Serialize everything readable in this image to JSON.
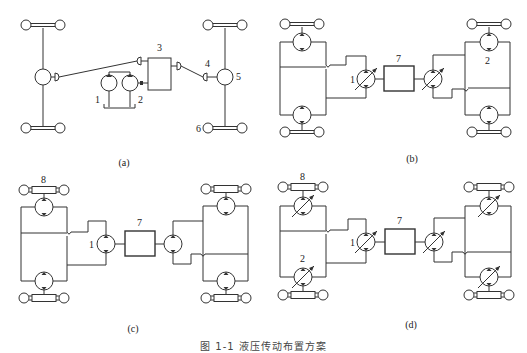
{
  "figure": {
    "caption": "图 1-1  液压传动布置方案",
    "panels": [
      {
        "id": "a",
        "label": "(a)",
        "callouts": [
          "1",
          "2",
          "3",
          "4",
          "5",
          "6"
        ]
      },
      {
        "id": "b",
        "label": "(b)",
        "callouts": [
          "1",
          "7",
          "2"
        ]
      },
      {
        "id": "c",
        "label": "(c)",
        "callouts": [
          "8",
          "1",
          "7"
        ]
      },
      {
        "id": "d",
        "label": "(d)",
        "callouts": [
          "8",
          "1",
          "7",
          "2"
        ]
      }
    ]
  },
  "legend_numbers": {
    "1": "pump",
    "2": "hydraulic motor",
    "3": "gearbox / transfer case",
    "4": "universal joint",
    "5": "differential / axle",
    "6": "wheel",
    "7": "engine",
    "8": "wheel hub assembly"
  }
}
